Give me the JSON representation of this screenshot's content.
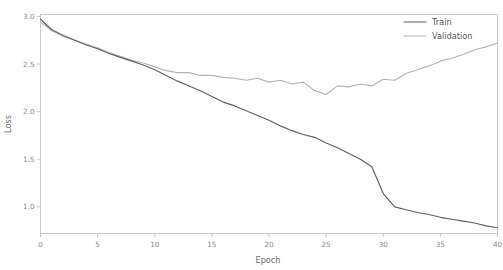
{
  "figure": {
    "clipped_top_text": "",
    "background_color": "#ffffff"
  },
  "axis": {
    "xlabel": "Epoch",
    "ylabel": "Loss",
    "xticks": [
      "0",
      "5",
      "10",
      "15",
      "20",
      "25",
      "30",
      "35",
      "40"
    ],
    "yticks": [
      "1.0",
      "1.5",
      "2.0",
      "2.5",
      "3.0"
    ]
  },
  "legend": {
    "train_label": "Train",
    "validation_label": "Validation"
  },
  "colors": {
    "train": "#606060",
    "validation": "#b4b4b4",
    "spine": "#c8c8c8",
    "tick_text": "#8a8a8a",
    "axis_text": "#6e6e6e"
  },
  "chart_data": {
    "type": "line",
    "title": "",
    "xlabel": "Epoch",
    "ylabel": "Loss",
    "xlim": [
      0,
      40
    ],
    "ylim": [
      0.72,
      3.02
    ],
    "xticks": [
      0,
      5,
      10,
      15,
      20,
      25,
      30,
      35,
      40
    ],
    "yticks": [
      1.0,
      1.5,
      2.0,
      2.5,
      3.0
    ],
    "grid": false,
    "legend_position": "upper right",
    "x": [
      0,
      1,
      2,
      3,
      4,
      5,
      6,
      7,
      8,
      9,
      10,
      11,
      12,
      13,
      14,
      15,
      16,
      17,
      18,
      19,
      20,
      21,
      22,
      23,
      24,
      25,
      26,
      27,
      28,
      29,
      30,
      31,
      32,
      33,
      34,
      35,
      36,
      37,
      38,
      39,
      40
    ],
    "series": [
      {
        "name": "Train",
        "color": "#606060",
        "values": [
          2.97,
          2.86,
          2.8,
          2.75,
          2.7,
          2.66,
          2.61,
          2.57,
          2.53,
          2.49,
          2.44,
          2.38,
          2.32,
          2.27,
          2.22,
          2.16,
          2.1,
          2.06,
          2.01,
          1.96,
          1.91,
          1.85,
          1.8,
          1.76,
          1.73,
          1.67,
          1.62,
          1.56,
          1.5,
          1.42,
          1.14,
          1.0,
          0.97,
          0.94,
          0.92,
          0.89,
          0.87,
          0.85,
          0.83,
          0.8,
          0.78
        ]
      },
      {
        "name": "Validation",
        "color": "#b4b4b4",
        "values": [
          2.94,
          2.85,
          2.79,
          2.75,
          2.71,
          2.67,
          2.62,
          2.58,
          2.54,
          2.51,
          2.47,
          2.43,
          2.41,
          2.41,
          2.38,
          2.38,
          2.36,
          2.35,
          2.33,
          2.35,
          2.31,
          2.33,
          2.29,
          2.31,
          2.22,
          2.18,
          2.27,
          2.26,
          2.29,
          2.27,
          2.34,
          2.33,
          2.4,
          2.44,
          2.48,
          2.53,
          2.56,
          2.6,
          2.65,
          2.68,
          2.72
        ]
      }
    ]
  }
}
